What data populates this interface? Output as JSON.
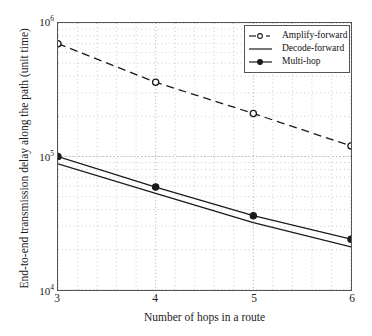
{
  "chart_data": {
    "type": "line",
    "title": "",
    "xlabel": "Number of hops in a route",
    "ylabel": "End-to-end transmission delay along the path (unit time)",
    "x": [
      3,
      4,
      5,
      6
    ],
    "xtick_labels": [
      "3",
      "4",
      "5",
      "6"
    ],
    "xlim": [
      3,
      6
    ],
    "yscale": "log",
    "ylim": [
      10000,
      1000000
    ],
    "ytick_labels": [
      "10⁴",
      "10⁵",
      "10⁶"
    ],
    "ytick_values": [
      10000,
      100000,
      1000000
    ],
    "ytick_mantissa": [
      "10",
      "10",
      "10"
    ],
    "ytick_exponent": [
      "4",
      "5",
      "6"
    ],
    "grid": true,
    "grid_style": "dotted-minor",
    "legend_position": "upper right",
    "series": [
      {
        "name": "Amplify-forward",
        "style": "dashed",
        "marker": "circle-open",
        "color": "#1a1a1a",
        "values": [
          700000,
          360000,
          210000,
          120000
        ]
      },
      {
        "name": "Decode-forward",
        "style": "solid",
        "marker": "none",
        "color": "#1a1a1a",
        "values": [
          88000,
          53000,
          32000,
          21000
        ]
      },
      {
        "name": "Multi-hop",
        "style": "solid",
        "marker": "circle-filled",
        "color": "#1a1a1a",
        "values": [
          100000,
          59000,
          36000,
          24000
        ]
      }
    ]
  },
  "legend": {
    "items": [
      {
        "label": "Amplify-forward"
      },
      {
        "label": "Decode-forward"
      },
      {
        "label": "Multi-hop"
      }
    ]
  },
  "axes": {
    "x_title": "Number of hops in a route",
    "y_title": "End-to-end transmission delay along the path (unit time)"
  },
  "colors": {
    "line": "#1a1a1a",
    "frame": "#555555",
    "grid": "#bbbbbb",
    "background": "#ffffff"
  }
}
